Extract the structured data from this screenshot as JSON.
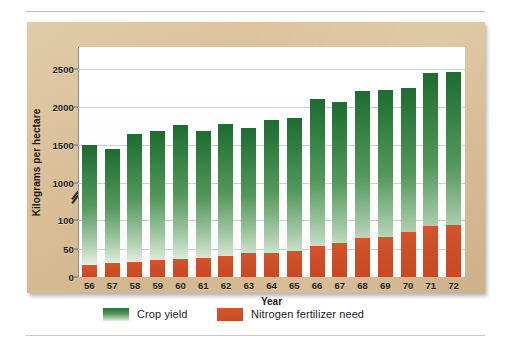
{
  "figure": {
    "y_axis_title": "Kilograms per hectare",
    "x_axis_title": "Year"
  },
  "legend": {
    "items": [
      {
        "label": "Crop yield",
        "color": "#2a7339",
        "swatch": "green-gradient-swatch"
      },
      {
        "label": "Nitrogen fertilizer need",
        "color": "#cc4f28",
        "swatch": "orange-swatch"
      }
    ]
  },
  "colors": {
    "panel_tan": "#d8bc93",
    "plot_background": "#ffffff",
    "gridline": "#c6d2e0",
    "crop_yield_green": "#2a7339",
    "fertilizer_orange": "#cc4f28",
    "axis": "#8a8d91",
    "text": "#231f1c"
  },
  "chart_data": {
    "type": "bar",
    "title": "",
    "subtitle": "",
    "xlabel": "Year",
    "ylabel": "Kilograms per hectare",
    "grid": true,
    "legend_position": "bottom",
    "axis_break": {
      "present": true,
      "between": [
        100,
        1000
      ],
      "symbol": "double-slash"
    },
    "y_ticks": [
      0,
      50,
      100,
      1000,
      1500,
      2000,
      2500
    ],
    "y_tick_labels": [
      "0",
      "50",
      "100",
      "1000",
      "1500",
      "2000",
      "2500"
    ],
    "ylim_low_segment": [
      0,
      100
    ],
    "ylim_high_segment": [
      1000,
      2500
    ],
    "categories": [
      "56",
      "57",
      "58",
      "59",
      "60",
      "61",
      "62",
      "63",
      "64",
      "65",
      "66",
      "67",
      "68",
      "69",
      "70",
      "71",
      "72"
    ],
    "series": [
      {
        "name": "Crop yield",
        "color": "#2a7339",
        "unit": "kilograms per hectare",
        "values": [
          1500,
          1450,
          1650,
          1680,
          1760,
          1680,
          1780,
          1720,
          1830,
          1860,
          2110,
          2070,
          2210,
          2230,
          2250,
          2450,
          2460
        ]
      },
      {
        "name": "Nitrogen fertilizer need",
        "color": "#cc4f28",
        "unit": "kilograms per hectare",
        "values": [
          21,
          25,
          27,
          29,
          31,
          33,
          37,
          42,
          43,
          45,
          55,
          60,
          68,
          70,
          79,
          89,
          91
        ]
      }
    ]
  }
}
